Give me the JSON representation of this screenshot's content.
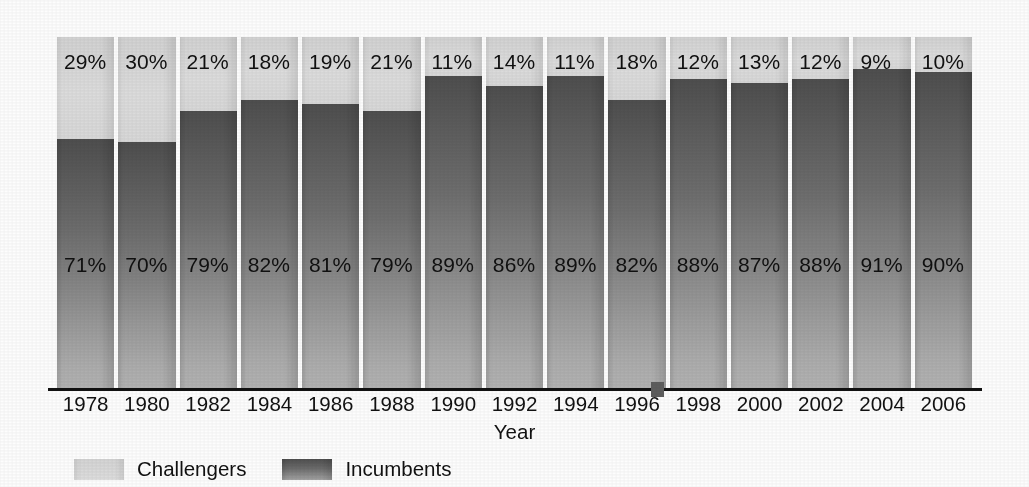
{
  "chart_data": {
    "type": "bar",
    "subtype": "100% stacked bar",
    "title": "",
    "subtitle": "",
    "xlabel": "Year",
    "ylabel": "",
    "ylim": [
      0,
      100
    ],
    "grid": false,
    "legend_position": "bottom-left",
    "categories": [
      "1978",
      "1980",
      "1982",
      "1984",
      "1986",
      "1988",
      "1990",
      "1992",
      "1994",
      "1996",
      "1998",
      "2000",
      "2002",
      "2004",
      "2006"
    ],
    "series": [
      {
        "name": "Challengers",
        "color": "#d8d8d8",
        "values": [
          29,
          30,
          21,
          18,
          19,
          21,
          11,
          14,
          11,
          18,
          12,
          13,
          12,
          9,
          10
        ],
        "labels": [
          "29%",
          "30%",
          "21%",
          "18%",
          "19%",
          "21%",
          "11%",
          "14%",
          "11%",
          "18%",
          "12%",
          "13%",
          "12%",
          "9%",
          "10%"
        ]
      },
      {
        "name": "Incumbents",
        "color": "#6e6e6e",
        "values": [
          71,
          70,
          79,
          82,
          81,
          79,
          89,
          86,
          89,
          82,
          88,
          87,
          88,
          91,
          90
        ],
        "labels": [
          "71%",
          "70%",
          "79%",
          "82%",
          "81%",
          "79%",
          "89%",
          "86%",
          "89%",
          "82%",
          "88%",
          "87%",
          "88%",
          "91%",
          "90%"
        ]
      }
    ]
  },
  "axis": {
    "x_title": "Year"
  },
  "legend": {
    "items": [
      {
        "label": "Challengers",
        "swatch": "challenger"
      },
      {
        "label": "Incumbents",
        "swatch": "incumbent"
      }
    ]
  },
  "colors": {
    "challenger": "#d8d8d8",
    "incumbent_top": "#4e4e4e",
    "incumbent_bottom": "#b2b2b2",
    "axis": "#111111",
    "text": "#111111",
    "background": "#ffffff"
  }
}
